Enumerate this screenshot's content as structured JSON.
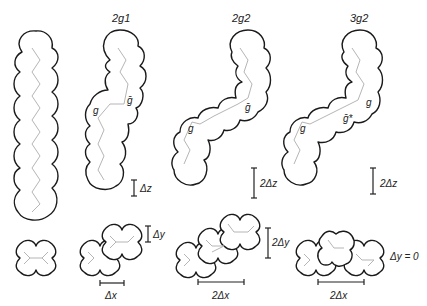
{
  "figure": {
    "panels": [
      {
        "id": "all-trans",
        "title": "",
        "labels": [],
        "scale_label": "",
        "xsec_labels": []
      },
      {
        "id": "2g1",
        "title": "2g1",
        "labels": [
          "g",
          "ḡ"
        ],
        "scale_label": "Δz",
        "xsec_labels": [
          "Δy",
          "Δx"
        ]
      },
      {
        "id": "2g2",
        "title": "2g2",
        "labels": [
          "g",
          "ḡ"
        ],
        "scale_label": "2Δz",
        "xsec_labels": [
          "2Δy",
          "2Δx"
        ]
      },
      {
        "id": "3g2",
        "title": "3g2",
        "labels": [
          "g",
          "g",
          "ḡ*"
        ],
        "scale_label": "2Δz",
        "xsec_labels": [
          "Δy = 0",
          "2Δx"
        ]
      }
    ]
  }
}
